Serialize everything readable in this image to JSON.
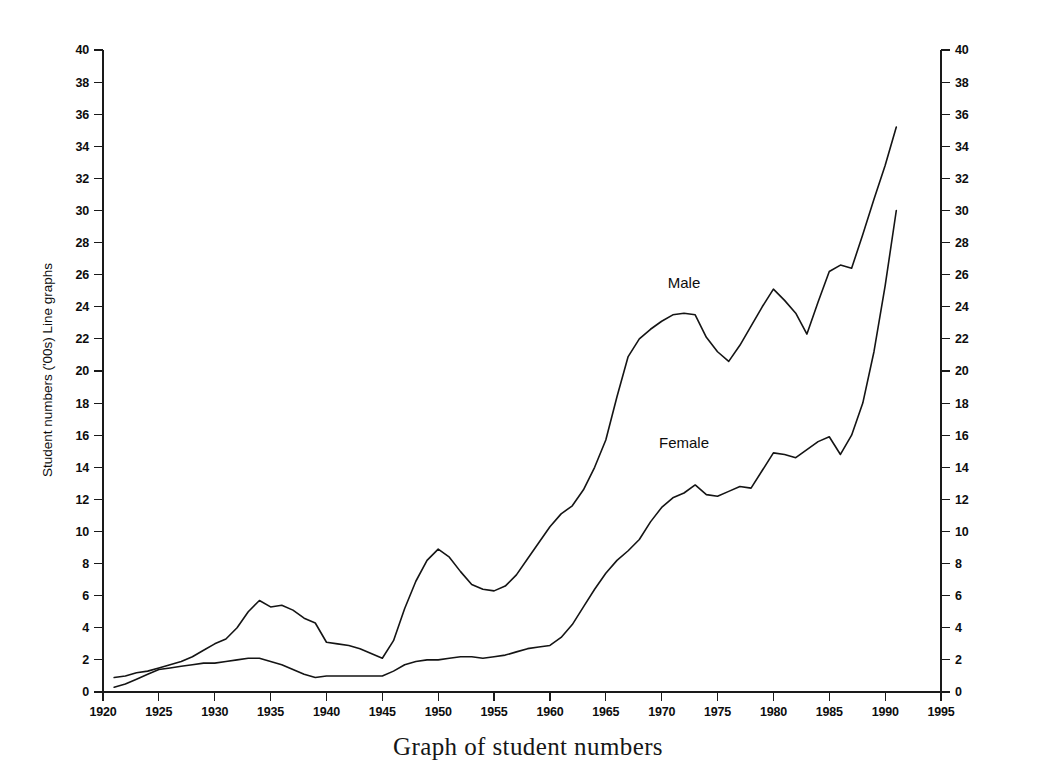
{
  "chart_data": {
    "type": "line",
    "title": "Graph of student numbers",
    "xlabel": "",
    "ylabel": "Student numbers ('00s) Line graphs",
    "xlim": [
      1920,
      1995
    ],
    "ylim": [
      0,
      40
    ],
    "xticks": [
      1920,
      1925,
      1930,
      1935,
      1940,
      1945,
      1950,
      1955,
      1960,
      1965,
      1970,
      1975,
      1980,
      1985,
      1990,
      1995
    ],
    "yticks": [
      0,
      2,
      4,
      6,
      8,
      10,
      12,
      14,
      16,
      18,
      20,
      22,
      24,
      26,
      28,
      30,
      32,
      34,
      36,
      38,
      40
    ],
    "grid": false,
    "legend_position": "inline-annotation",
    "y_axis_right_mirrored": true,
    "series": [
      {
        "name": "Male",
        "label_x": 1972,
        "label_y": 25.2,
        "x": [
          1921,
          1922,
          1923,
          1924,
          1925,
          1926,
          1927,
          1928,
          1929,
          1930,
          1931,
          1932,
          1933,
          1934,
          1935,
          1936,
          1937,
          1938,
          1939,
          1940,
          1941,
          1942,
          1943,
          1944,
          1945,
          1946,
          1947,
          1948,
          1949,
          1950,
          1951,
          1952,
          1953,
          1954,
          1955,
          1956,
          1957,
          1958,
          1959,
          1960,
          1961,
          1962,
          1963,
          1964,
          1965,
          1966,
          1967,
          1968,
          1969,
          1970,
          1971,
          1972,
          1973,
          1974,
          1975,
          1976,
          1977,
          1978,
          1979,
          1980,
          1981,
          1982,
          1983,
          1984,
          1985,
          1986,
          1987,
          1988,
          1989,
          1990,
          1991
        ],
        "values": [
          0.9,
          1.0,
          1.2,
          1.3,
          1.5,
          1.7,
          1.9,
          2.2,
          2.6,
          3.0,
          3.3,
          4.0,
          5.0,
          5.7,
          5.3,
          5.4,
          5.1,
          4.6,
          4.3,
          3.1,
          3.0,
          2.9,
          2.7,
          2.4,
          2.1,
          3.2,
          5.2,
          6.9,
          8.2,
          8.9,
          8.4,
          7.5,
          6.7,
          6.4,
          6.3,
          6.6,
          7.3,
          8.3,
          9.3,
          10.3,
          11.1,
          11.6,
          12.6,
          14.0,
          15.7,
          18.4,
          20.9,
          22.0,
          22.6,
          23.1,
          23.5,
          23.6,
          23.5,
          22.1,
          21.2,
          20.6,
          21.6,
          22.8,
          24.0,
          25.1,
          24.4,
          23.6,
          22.3,
          24.3,
          26.2,
          26.6,
          26.4,
          28.5,
          30.7,
          32.8,
          35.2
        ]
      },
      {
        "name": "Female",
        "label_x": 1972,
        "label_y": 15.2,
        "x": [
          1921,
          1922,
          1923,
          1924,
          1925,
          1926,
          1927,
          1928,
          1929,
          1930,
          1931,
          1932,
          1933,
          1934,
          1935,
          1936,
          1937,
          1938,
          1939,
          1940,
          1941,
          1942,
          1943,
          1944,
          1945,
          1946,
          1947,
          1948,
          1949,
          1950,
          1951,
          1952,
          1953,
          1954,
          1955,
          1956,
          1957,
          1958,
          1959,
          1960,
          1961,
          1962,
          1963,
          1964,
          1965,
          1966,
          1967,
          1968,
          1969,
          1970,
          1971,
          1972,
          1973,
          1974,
          1975,
          1976,
          1977,
          1978,
          1979,
          1980,
          1981,
          1982,
          1983,
          1984,
          1985,
          1986,
          1987,
          1988,
          1989,
          1990,
          1991
        ],
        "values": [
          0.3,
          0.5,
          0.8,
          1.1,
          1.4,
          1.5,
          1.6,
          1.7,
          1.8,
          1.8,
          1.9,
          2.0,
          2.1,
          2.1,
          1.9,
          1.7,
          1.4,
          1.1,
          0.9,
          1.0,
          1.0,
          1.0,
          1.0,
          1.0,
          1.0,
          1.3,
          1.7,
          1.9,
          2.0,
          2.0,
          2.1,
          2.2,
          2.2,
          2.1,
          2.2,
          2.3,
          2.5,
          2.7,
          2.8,
          2.9,
          3.4,
          4.2,
          5.3,
          6.4,
          7.4,
          8.2,
          8.8,
          9.5,
          10.6,
          11.5,
          12.1,
          12.4,
          12.9,
          12.3,
          12.2,
          12.5,
          12.8,
          12.7,
          13.8,
          14.9,
          14.8,
          14.6,
          15.1,
          15.6,
          15.9,
          14.8,
          16.0,
          18.0,
          21.2,
          25.3,
          30.0
        ]
      }
    ]
  }
}
